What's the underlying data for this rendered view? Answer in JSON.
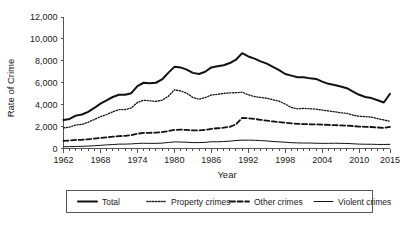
{
  "chart_data": {
    "type": "line",
    "title": "",
    "xlabel": "Year",
    "ylabel": "Rate of Crime",
    "xlim": [
      1962,
      2015
    ],
    "ylim": [
      0,
      12000
    ],
    "grid": false,
    "legend_position": "bottom",
    "x_tick_labels": [
      "1962",
      "1968",
      "1974",
      "1980",
      "1986",
      "1992",
      "1998",
      "2004",
      "2010",
      "2015"
    ],
    "x_tick_values": [
      1962,
      1968,
      1974,
      1980,
      1986,
      1992,
      1998,
      2004,
      2010,
      2015
    ],
    "y_tick_labels": [
      "0",
      "2,000",
      "4,000",
      "6,000",
      "8,000",
      "10,000",
      "12,000"
    ],
    "y_tick_values": [
      0,
      2000,
      4000,
      6000,
      8000,
      10000,
      12000
    ],
    "x": [
      1962,
      1963,
      1964,
      1965,
      1966,
      1967,
      1968,
      1969,
      1970,
      1971,
      1972,
      1973,
      1974,
      1975,
      1976,
      1977,
      1978,
      1979,
      1980,
      1981,
      1982,
      1983,
      1984,
      1985,
      1986,
      1987,
      1988,
      1989,
      1990,
      1991,
      1992,
      1993,
      1994,
      1995,
      1996,
      1997,
      1998,
      1999,
      2000,
      2001,
      2002,
      2003,
      2004,
      2005,
      2006,
      2007,
      2008,
      2009,
      2010,
      2011,
      2012,
      2013,
      2014,
      2015
    ],
    "series": [
      {
        "name": "Total",
        "style": "solid-thick",
        "values": [
          2610,
          2700,
          3000,
          3100,
          3350,
          3700,
          4100,
          4400,
          4700,
          4900,
          4900,
          5050,
          5700,
          6000,
          5950,
          6000,
          6300,
          6900,
          7450,
          7400,
          7200,
          6900,
          6800,
          7000,
          7400,
          7500,
          7600,
          7800,
          8100,
          8700,
          8400,
          8200,
          7950,
          7750,
          7450,
          7150,
          6800,
          6650,
          6500,
          6500,
          6400,
          6350,
          6100,
          5900,
          5800,
          5650,
          5500,
          5200,
          4900,
          4700,
          4600,
          4400,
          4200,
          5000
        ]
      },
      {
        "name": "Property crimes",
        "style": "dotted",
        "values": [
          1880,
          1950,
          2150,
          2200,
          2400,
          2650,
          2900,
          3100,
          3350,
          3550,
          3550,
          3700,
          4200,
          4400,
          4350,
          4300,
          4400,
          4750,
          5350,
          5250,
          5050,
          4650,
          4500,
          4650,
          4880,
          4940,
          5030,
          5080,
          5090,
          5140,
          4900,
          4740,
          4660,
          4590,
          4450,
          4320,
          4050,
          3740,
          3620,
          3660,
          3630,
          3590,
          3510,
          3430,
          3350,
          3260,
          3210,
          3040,
          2940,
          2910,
          2860,
          2730,
          2600,
          2490
        ]
      },
      {
        "name": "Other crimes",
        "style": "dashed",
        "values": [
          700,
          720,
          780,
          800,
          840,
          900,
          960,
          1020,
          1080,
          1130,
          1160,
          1220,
          1350,
          1420,
          1430,
          1450,
          1500,
          1580,
          1700,
          1720,
          1700,
          1660,
          1650,
          1700,
          1800,
          1850,
          1900,
          1980,
          2200,
          2800,
          2750,
          2700,
          2620,
          2540,
          2470,
          2400,
          2350,
          2300,
          2250,
          2230,
          2210,
          2200,
          2180,
          2150,
          2130,
          2110,
          2090,
          2050,
          2000,
          1980,
          1960,
          1920,
          1880,
          1980
        ]
      },
      {
        "name": "Violent crimes",
        "style": "solid-thin",
        "values": [
          160,
          170,
          190,
          200,
          220,
          250,
          290,
          330,
          360,
          400,
          400,
          420,
          460,
          480,
          470,
          470,
          490,
          550,
          600,
          590,
          570,
          540,
          540,
          560,
          620,
          610,
          640,
          670,
          730,
          760,
          760,
          750,
          720,
          690,
          640,
          610,
          570,
          530,
          510,
          500,
          500,
          480,
          470,
          470,
          480,
          470,
          460,
          430,
          400,
          390,
          390,
          370,
          370,
          380
        ]
      }
    ],
    "legend": [
      {
        "label": "Total",
        "style": "solid-thick"
      },
      {
        "label": "Property crimes",
        "style": "dotted"
      },
      {
        "label": "Other crimes",
        "style": "dashed"
      },
      {
        "label": "Violent crimes",
        "style": "solid-thin"
      }
    ],
    "colors": {
      "line": "#111111",
      "axis": "#555555",
      "background": "#ffffff"
    }
  }
}
